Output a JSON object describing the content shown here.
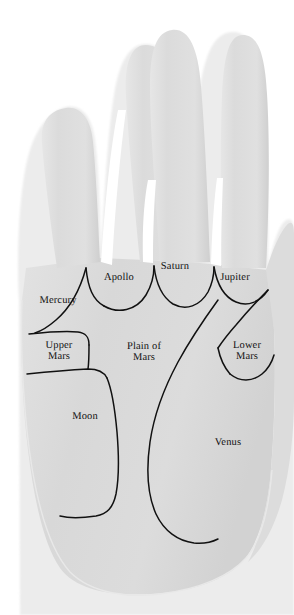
{
  "diagram": {
    "background_color": "#ffffff",
    "palm_fill_color": "#d9d9d9",
    "palm_edge_color": "#ececec",
    "line_color": "#111111",
    "label_color": "#101010"
  },
  "labels": {
    "mercury": "Mercury",
    "apollo": "Apollo",
    "saturn": "Saturn",
    "jupiter": "Jupiter",
    "upper_mars": "Upper\nMars",
    "plain_of_mars": "Plain of\nMars",
    "lower_mars": "Lower\nMars",
    "moon": "Moon",
    "venus": "Venus"
  },
  "regions": [
    {
      "name": "mercury",
      "label": "Mercury",
      "finger": "little"
    },
    {
      "name": "apollo",
      "label": "Apollo",
      "finger": "ring"
    },
    {
      "name": "saturn",
      "label": "Saturn",
      "finger": "middle"
    },
    {
      "name": "jupiter",
      "label": "Jupiter",
      "finger": "index"
    },
    {
      "name": "upper-mars",
      "label": "Upper Mars",
      "finger": ""
    },
    {
      "name": "plain-of-mars",
      "label": "Plain of Mars",
      "finger": ""
    },
    {
      "name": "lower-mars",
      "label": "Lower Mars",
      "finger": ""
    },
    {
      "name": "moon",
      "label": "Moon",
      "finger": ""
    },
    {
      "name": "venus",
      "label": "Venus",
      "finger": ""
    }
  ]
}
